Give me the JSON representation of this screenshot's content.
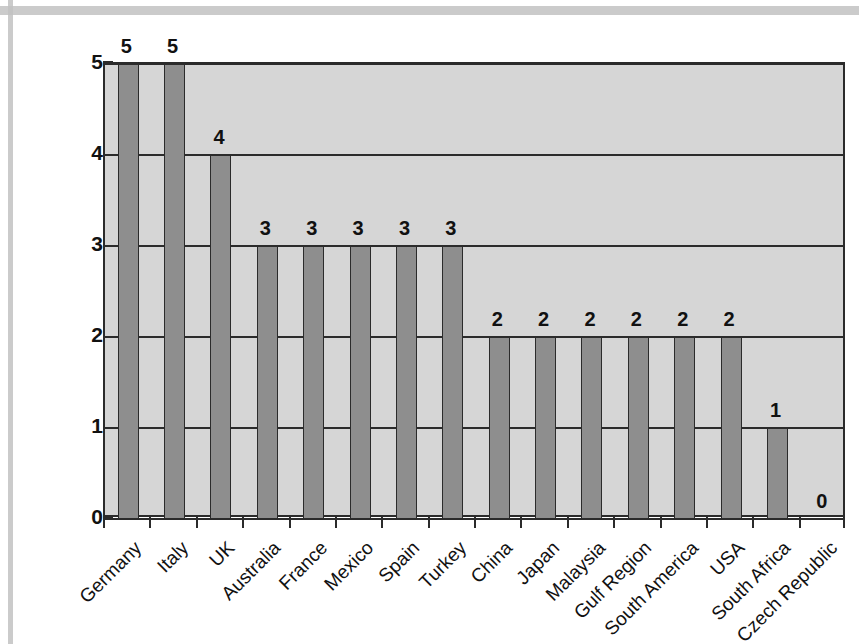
{
  "chart_data": {
    "type": "bar",
    "title": "",
    "subtitle": "",
    "xlabel": "",
    "ylabel": "No. of global motorsport events",
    "ylim": [
      0,
      5
    ],
    "y_ticks": [
      "0",
      "1",
      "2",
      "3",
      "4",
      "5"
    ],
    "grid": true,
    "legend": "none",
    "orientation": "vertical",
    "bar_color": "#8e8e8e",
    "bar_edge_color": "#2b2b2b",
    "plot_background": "#d6d6d6",
    "categories": [
      "Germany",
      "Italy",
      "UK",
      "Australia",
      "France",
      "Mexico",
      "Spain",
      "Turkey",
      "China",
      "Japan",
      "Malaysia",
      "Gulf Region",
      "South America",
      "USA",
      "South Africa",
      "Czech Republic"
    ],
    "values": [
      5,
      5,
      4,
      3,
      3,
      3,
      3,
      3,
      2,
      2,
      2,
      2,
      2,
      2,
      1,
      0
    ],
    "data_labels": [
      "5",
      "5",
      "4",
      "3",
      "3",
      "3",
      "3",
      "3",
      "2",
      "2",
      "2",
      "2",
      "2",
      "2",
      "1",
      "0"
    ]
  },
  "page": {
    "frame_color": "#c2c2c2"
  }
}
